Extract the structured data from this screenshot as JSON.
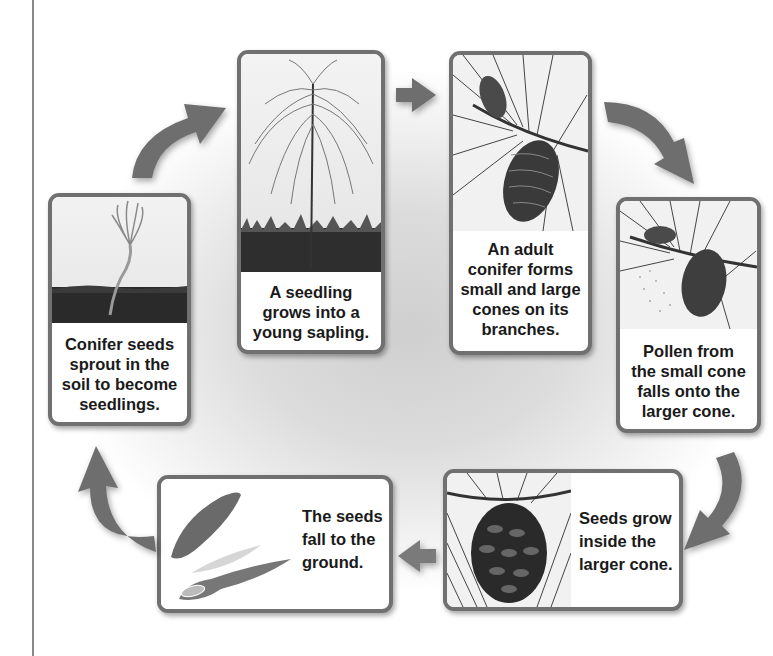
{
  "diagram": {
    "stages": [
      {
        "id": "sprout",
        "caption_lines": [
          "Conifer seeds",
          "sprout in the",
          "soil to become",
          "seedlings."
        ],
        "illustration": "seedling-sprout"
      },
      {
        "id": "sapling",
        "caption_lines": [
          "A seedling",
          "grows into a",
          "young sapling."
        ],
        "illustration": "young-sapling"
      },
      {
        "id": "adult",
        "caption_lines": [
          "An adult",
          "conifer forms",
          "small and large",
          "cones on its",
          "branches."
        ],
        "illustration": "pine-branch-cones"
      },
      {
        "id": "pollen",
        "caption_lines": [
          "Pollen from",
          "the small cone",
          "falls onto the",
          "larger cone."
        ],
        "illustration": "pollen-falling"
      },
      {
        "id": "seeds-grow",
        "caption_lines": [
          "Seeds grow",
          "inside the",
          "larger cone."
        ],
        "illustration": "large-pine-cone"
      },
      {
        "id": "seeds-fall",
        "caption_lines": [
          "The seeds",
          "fall to the",
          "ground."
        ],
        "illustration": "winged-seeds"
      }
    ],
    "arrows": [
      {
        "from": "sprout",
        "to": "sapling",
        "shape": "curved"
      },
      {
        "from": "sapling",
        "to": "adult",
        "shape": "straight"
      },
      {
        "from": "adult",
        "to": "pollen",
        "shape": "curved"
      },
      {
        "from": "pollen",
        "to": "seeds-grow",
        "shape": "curved"
      },
      {
        "from": "seeds-grow",
        "to": "seeds-fall",
        "shape": "straight"
      },
      {
        "from": "seeds-fall",
        "to": "sprout",
        "shape": "curved"
      }
    ],
    "colors": {
      "card_border": "#707070",
      "arrow": "#6e6e6e",
      "backdrop": "#cfcfcf",
      "text": "#1a1a1a"
    }
  }
}
